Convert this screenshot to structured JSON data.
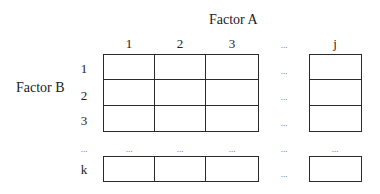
{
  "diagram": {
    "type": "two-factor grid layout",
    "factor_a": {
      "label": "Factor A",
      "levels": [
        "1",
        "2",
        "3",
        "...",
        "j"
      ]
    },
    "factor_b": {
      "label": "Factor B",
      "levels": [
        "1",
        "2",
        "3",
        "...",
        "k"
      ]
    },
    "ellipsis": "...",
    "line_color": "#2a2a2a"
  }
}
